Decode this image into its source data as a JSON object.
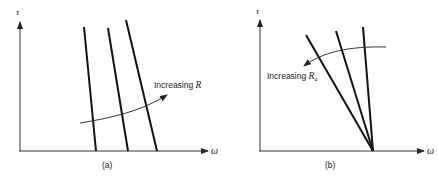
{
  "figure": {
    "panels": [
      {
        "id": "a",
        "caption": "(a)",
        "y_axis_label": "τ",
        "x_axis_label": "ω",
        "annotation": "Increasing ",
        "annotation_var": "R",
        "annotation_sub": "",
        "line_count": 3,
        "description": "Three nearly parallel steep torque-speed lines shifting right"
      },
      {
        "id": "b",
        "caption": "(b)",
        "y_axis_label": "τ",
        "x_axis_label": "ω",
        "annotation": "Increasing ",
        "annotation_var": "R",
        "annotation_sub": "a",
        "line_count": 3,
        "description": "Three torque-speed lines sharing a common ω-intercept with decreasing slope"
      }
    ],
    "colors": {
      "line": "#111111",
      "axis": "#333333",
      "background": "#ffffff"
    }
  }
}
